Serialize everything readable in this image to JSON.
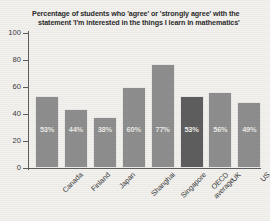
{
  "chart_data": {
    "type": "bar",
    "title": "Percentage of students who 'agree' or 'strongly agree' with the statement 'I'm interested in the things I learn in mathematics'",
    "title_line1": "Percentage of students who 'agree' or 'strongly agree' with the",
    "title_line2": "statement 'I'm interested in the things I learn in mathematics'",
    "xlabel": "",
    "ylabel": "",
    "ylim": [
      0,
      100
    ],
    "yticks": [
      0,
      20,
      40,
      60,
      80,
      100
    ],
    "ytick_labels": [
      "0",
      "20",
      "40",
      "60",
      "80",
      "100"
    ],
    "grid": false,
    "legend": false,
    "categories": [
      "Canada",
      "Finland",
      "Japan",
      "Shanghai",
      "Singapore",
      "OECD average",
      "UK",
      "US"
    ],
    "category_lines": [
      [
        "Canada"
      ],
      [
        "Finland"
      ],
      [
        "Japan"
      ],
      [
        "Shanghai"
      ],
      [
        "Singapore"
      ],
      [
        "OECD",
        "average"
      ],
      [
        "UK"
      ],
      [
        "US"
      ]
    ],
    "values": [
      53,
      44,
      38,
      60,
      77,
      53,
      56,
      49
    ],
    "value_labels": [
      "53%",
      "44%",
      "38%",
      "60%",
      "77%",
      "53%",
      "56%",
      "49%"
    ],
    "highlight_index": 5,
    "bar_color": "#8e8e8e",
    "highlight_color": "#5e5e5e",
    "value_label_color": "#f0efec",
    "axis_color": "#5d5d5d",
    "background_color": "#f2f1ee"
  }
}
